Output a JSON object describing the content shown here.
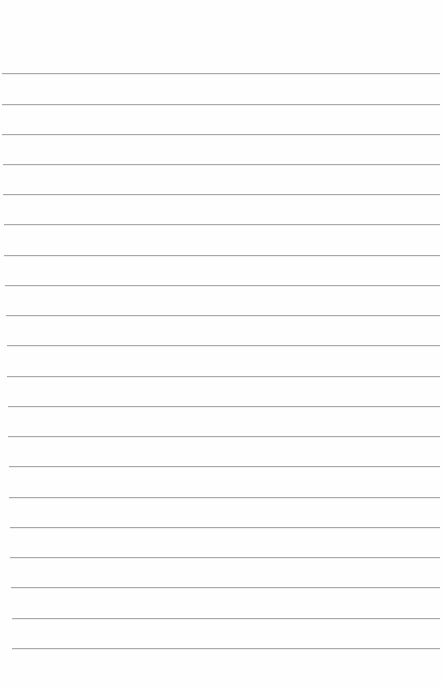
{
  "page": {
    "type": "blank ruled paper",
    "background_color": "#fefefe",
    "rule_color": "#a9a9a9",
    "rules": [
      {
        "y": 73,
        "x1": 2,
        "x2": 440
      },
      {
        "y": 104,
        "x1": 2,
        "x2": 440
      },
      {
        "y": 134,
        "x1": 2,
        "x2": 440
      },
      {
        "y": 164,
        "x1": 3,
        "x2": 440
      },
      {
        "y": 194,
        "x1": 3,
        "x2": 440
      },
      {
        "y": 224,
        "x1": 4,
        "x2": 440
      },
      {
        "y": 255,
        "x1": 4,
        "x2": 440
      },
      {
        "y": 285,
        "x1": 5,
        "x2": 440
      },
      {
        "y": 315,
        "x1": 6,
        "x2": 440
      },
      {
        "y": 345,
        "x1": 7,
        "x2": 440
      },
      {
        "y": 376,
        "x1": 7,
        "x2": 440
      },
      {
        "y": 406,
        "x1": 8,
        "x2": 440
      },
      {
        "y": 436,
        "x1": 8,
        "x2": 440
      },
      {
        "y": 466,
        "x1": 9,
        "x2": 440
      },
      {
        "y": 497,
        "x1": 9,
        "x2": 440
      },
      {
        "y": 527,
        "x1": 10,
        "x2": 440
      },
      {
        "y": 557,
        "x1": 10,
        "x2": 440
      },
      {
        "y": 587,
        "x1": 11,
        "x2": 440
      },
      {
        "y": 618,
        "x1": 12,
        "x2": 440
      },
      {
        "y": 648,
        "x1": 12,
        "x2": 440
      }
    ]
  }
}
